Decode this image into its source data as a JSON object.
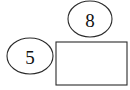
{
  "diagram": {
    "type": "shape-diagram",
    "background_color": "#ffffff",
    "stroke_color": "#2b2b2b",
    "fill_color": "#ffffff",
    "label_color": "#111111",
    "canvas": {
      "width": 130,
      "height": 90
    },
    "shapes": [
      {
        "id": "ellipse-top",
        "kind": "ellipse",
        "label": "8",
        "cx": 90,
        "cy": 19,
        "rx": 22,
        "ry": 18
      },
      {
        "id": "ellipse-left",
        "kind": "ellipse",
        "label": "5",
        "cx": 30,
        "cy": 56,
        "rx": 23,
        "ry": 18
      },
      {
        "id": "rectangle-main",
        "kind": "rectangle",
        "label": "",
        "x": 56,
        "y": 42,
        "width": 71,
        "height": 43
      }
    ]
  }
}
